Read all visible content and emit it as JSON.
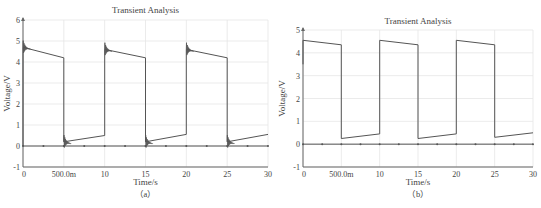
{
  "chart_data": [
    {
      "id": "a",
      "type": "line",
      "title": "Transient Analysis",
      "xlabel": "Time/s",
      "ylabel": "Voltage/V",
      "caption": "（a）",
      "xlim": [
        0,
        30
      ],
      "ylim": [
        -1,
        6
      ],
      "x_ticks": [
        0,
        5,
        10,
        15,
        20,
        25,
        30
      ],
      "x_tick_labels": [
        "0",
        "500.0m",
        "10",
        "15",
        "20",
        "25",
        "30"
      ],
      "y_ticks": [
        -1,
        0,
        1,
        2,
        3,
        4,
        5,
        6
      ],
      "y_tick_labels": [
        "-1",
        "0",
        "1",
        "2",
        "3",
        "4",
        "5",
        "6"
      ],
      "grid": true,
      "series": [
        {
          "name": "output voltage",
          "color": "#555555",
          "ringing": true,
          "x": [
            0,
            0,
            5,
            5,
            10,
            10,
            15,
            15,
            20,
            20,
            25,
            25,
            30
          ],
          "y": [
            0,
            4.7,
            4.2,
            0.2,
            0.5,
            4.6,
            4.2,
            0.2,
            0.55,
            4.6,
            4.2,
            0.2,
            0.55
          ]
        },
        {
          "name": "baseline",
          "color": "#555555",
          "marker": "dot",
          "x": [
            0,
            30
          ],
          "y": [
            0,
            0
          ]
        }
      ]
    },
    {
      "id": "b",
      "type": "line",
      "title": "Transient Analysis",
      "xlabel": "Time/s",
      "ylabel": "Voltage/V",
      "caption": "（b）",
      "xlim": [
        0,
        30
      ],
      "ylim": [
        -1,
        5
      ],
      "x_ticks": [
        0,
        5,
        10,
        15,
        20,
        25,
        30
      ],
      "x_tick_labels": [
        "0",
        "500.0m",
        "10",
        "15",
        "20",
        "25",
        "30"
      ],
      "y_ticks": [
        -1,
        0,
        1,
        2,
        3,
        4,
        5
      ],
      "y_tick_labels": [
        "-1",
        "0",
        "1",
        "2",
        "3",
        "4",
        "5"
      ],
      "grid": true,
      "series": [
        {
          "name": "output voltage",
          "color": "#555555",
          "ringing": false,
          "x": [
            0,
            0,
            5,
            5,
            10,
            10,
            15,
            15,
            20,
            20,
            25,
            25,
            30
          ],
          "y": [
            3.5,
            4.55,
            4.35,
            0.25,
            0.45,
            4.55,
            4.35,
            0.25,
            0.45,
            4.55,
            4.35,
            0.3,
            0.5
          ]
        },
        {
          "name": "baseline",
          "color": "#555555",
          "marker": "dot",
          "x": [
            0,
            30
          ],
          "y": [
            0,
            0
          ]
        }
      ]
    }
  ],
  "layout": {
    "a": {
      "left": 23,
      "right": 268,
      "top": 20,
      "bottom": 167,
      "title_y": 13,
      "xlabel_y": 185,
      "caption_y": 197,
      "ylabel_x": 10
    },
    "b": {
      "left": 303,
      "right": 533,
      "top": 30,
      "bottom": 167,
      "title_y": 24,
      "xlabel_y": 185,
      "caption_y": 197,
      "ylabel_x": 285
    }
  },
  "colors": {
    "axis": "#666666",
    "grid": "#e6e6e6",
    "trace": "#555555",
    "text": "#444444"
  }
}
